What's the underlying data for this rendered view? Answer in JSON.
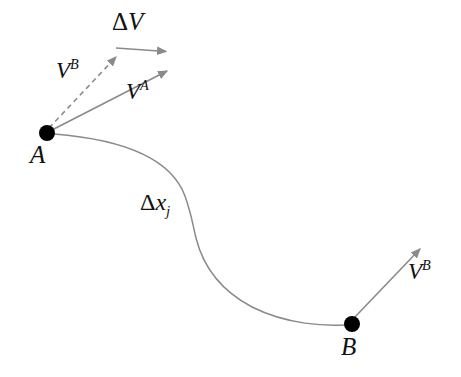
{
  "figure": {
    "width": 461,
    "height": 377,
    "background_color": "#ffffff",
    "curve_color": "#8a8a8a",
    "vector_color": "#8a8a8a",
    "point_color": "#000000",
    "text_color": "#111111"
  },
  "points": {
    "a": {
      "label": "A",
      "x": 47,
      "y": 133,
      "radius": 8
    },
    "b": {
      "label": "B",
      "x": 352,
      "y": 324,
      "radius": 8
    }
  },
  "path": {
    "label_delta": "Δ",
    "label_x": "x",
    "label_sub": "j",
    "inflection_x": 195,
    "inflection_y": 235
  },
  "vectors": {
    "v_b_at_a": {
      "symbol": "V",
      "superscript": "B",
      "style": "dashed",
      "from_x": 47,
      "from_y": 133,
      "to_x": 120,
      "to_y": 53
    },
    "v_a": {
      "symbol": "V",
      "superscript": "A",
      "style": "solid",
      "from_x": 47,
      "from_y": 133,
      "to_x": 172,
      "to_y": 68
    },
    "delta_v": {
      "symbol_delta": "Δ",
      "symbol": "V",
      "style": "solid",
      "from_x": 116,
      "from_y": 48,
      "to_x": 172,
      "to_y": 52
    },
    "v_b_at_b": {
      "symbol": "V",
      "superscript": "B",
      "style": "solid",
      "from_x": 352,
      "from_y": 324,
      "to_x": 424,
      "to_y": 245
    }
  }
}
